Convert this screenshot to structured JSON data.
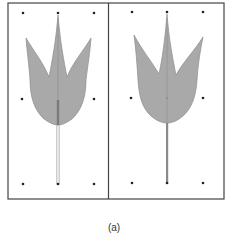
{
  "figure": {
    "caption": "(a)",
    "panels": [
      {
        "id": "left",
        "description": "three-lobed leaf shape with control points, light hollow stem",
        "control_points": [
          [
            23,
            13
          ],
          [
            58,
            13
          ],
          [
            94,
            13
          ],
          [
            22,
            99
          ],
          [
            94,
            99
          ],
          [
            23,
            184
          ],
          [
            58,
            184
          ],
          [
            94,
            184
          ]
        ],
        "stem_style": "light"
      },
      {
        "id": "right",
        "description": "three-lobed leaf shape with control points, solid stem",
        "control_points": [
          [
            132,
            12
          ],
          [
            167,
            12
          ],
          [
            203,
            12
          ],
          [
            131,
            98
          ],
          [
            203,
            98
          ],
          [
            132,
            183
          ],
          [
            167,
            183
          ],
          [
            203,
            183
          ]
        ],
        "stem_style": "solid"
      }
    ],
    "colors": {
      "leaf_fill": "#a9a9a9",
      "leaf_stroke": "#8c8c8c",
      "frame": "#444444",
      "point": "#222222",
      "stem_light": "#c8c8c8",
      "stem_dark": "#888888"
    }
  }
}
